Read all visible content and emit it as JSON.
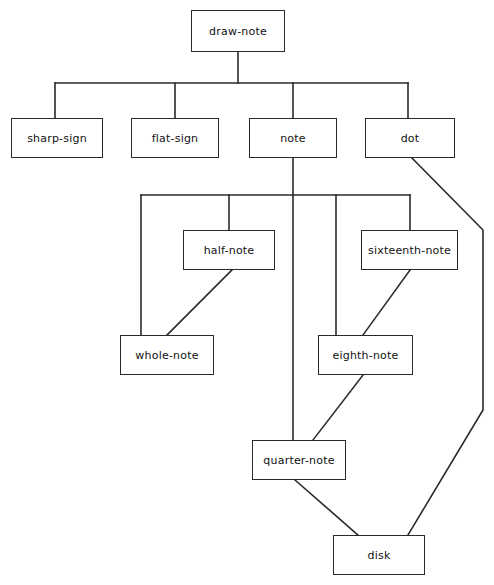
{
  "diagram": {
    "title": "draw-note",
    "type": "call-graph",
    "background_color": "#ffffff",
    "line_color": "#2a2a2a",
    "box_fill": "#ffffff",
    "text_color": "#111111",
    "nodes": [
      {
        "id": "draw-note",
        "label": "draw-note",
        "x": 191,
        "y": 10,
        "w": 94,
        "h": 42
      },
      {
        "id": "sharp-sign",
        "label": "sharp-sign",
        "x": 11,
        "y": 118,
        "w": 92,
        "h": 40
      },
      {
        "id": "flat-sign",
        "label": "flat-sign",
        "x": 131,
        "y": 118,
        "w": 88,
        "h": 40
      },
      {
        "id": "note",
        "label": "note",
        "x": 249,
        "y": 118,
        "w": 88,
        "h": 40
      },
      {
        "id": "dot",
        "label": "dot",
        "x": 365,
        "y": 118,
        "w": 90,
        "h": 40
      },
      {
        "id": "half-note",
        "label": "half-note",
        "x": 183,
        "y": 230,
        "w": 92,
        "h": 40
      },
      {
        "id": "sixteenth-note",
        "label": "sixteenth-note",
        "x": 361,
        "y": 230,
        "w": 97,
        "h": 40
      },
      {
        "id": "whole-note",
        "label": "whole-note",
        "x": 120,
        "y": 335,
        "w": 94,
        "h": 40
      },
      {
        "id": "eighth-note",
        "label": "eighth-note",
        "x": 318,
        "y": 335,
        "w": 95,
        "h": 40
      },
      {
        "id": "quarter-note",
        "label": "quarter-note",
        "x": 252,
        "y": 440,
        "w": 94,
        "h": 40
      },
      {
        "id": "disk",
        "label": "disk",
        "x": 333,
        "y": 535,
        "w": 92,
        "h": 40
      }
    ],
    "edges": [
      {
        "from": "draw-note",
        "to": "sharp-sign",
        "style": "orthogonal"
      },
      {
        "from": "draw-note",
        "to": "flat-sign",
        "style": "orthogonal"
      },
      {
        "from": "draw-note",
        "to": "note",
        "style": "orthogonal"
      },
      {
        "from": "draw-note",
        "to": "dot",
        "style": "orthogonal"
      },
      {
        "from": "note",
        "to": "whole-note",
        "style": "orthogonal"
      },
      {
        "from": "note",
        "to": "half-note",
        "style": "orthogonal"
      },
      {
        "from": "note",
        "to": "quarter-note",
        "style": "orthogonal"
      },
      {
        "from": "note",
        "to": "eighth-note",
        "style": "orthogonal"
      },
      {
        "from": "note",
        "to": "sixteenth-note",
        "style": "orthogonal"
      },
      {
        "from": "half-note",
        "to": "whole-note",
        "style": "diagonal"
      },
      {
        "from": "sixteenth-note",
        "to": "eighth-note",
        "style": "diagonal"
      },
      {
        "from": "eighth-note",
        "to": "quarter-note",
        "style": "diagonal"
      },
      {
        "from": "quarter-note",
        "to": "disk",
        "style": "diagonal"
      },
      {
        "from": "dot",
        "to": "disk",
        "style": "polyline-right"
      }
    ]
  }
}
